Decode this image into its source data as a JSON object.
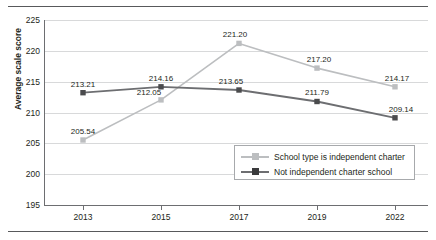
{
  "chart_data": {
    "type": "line",
    "title": "",
    "xlabel": "",
    "ylabel": "Average scale score",
    "categories": [
      "2013",
      "2015",
      "2017",
      "2019",
      "2022"
    ],
    "ylim": [
      195,
      225
    ],
    "yticks": [
      195,
      200,
      205,
      210,
      215,
      220,
      225
    ],
    "grid": true,
    "legend_position": "inside-lower-right",
    "series": [
      {
        "name": "School type is independent charter",
        "color": "#bcbec0",
        "marker": "square",
        "values": [
          205.54,
          212.05,
          221.2,
          217.2,
          214.17
        ],
        "labels": [
          "205.54",
          "212.05",
          "221.20",
          "217.20",
          "214.17"
        ]
      },
      {
        "name": "Not independent charter school",
        "color": "#6d6e71",
        "marker": "square",
        "values": [
          213.21,
          214.16,
          213.65,
          211.79,
          209.14
        ],
        "labels": [
          "213.21",
          "214.16",
          "213.65",
          "211.79",
          "209.14"
        ]
      }
    ]
  },
  "axis": {
    "y_label": "Average scale score",
    "y_tick_labels": [
      "225",
      "220",
      "215",
      "210",
      "205",
      "200",
      "195"
    ],
    "x_tick_labels": [
      "2013",
      "2015",
      "2017",
      "2019",
      "2022"
    ]
  },
  "legend": {
    "entries": [
      {
        "label": "School type is independent charter"
      },
      {
        "label": "Not independent charter school"
      }
    ]
  },
  "colors": {
    "series_light": "#bcbec0",
    "series_dark": "#6d6e71",
    "gridline": "#d8d9da",
    "axis": "#6d6e71",
    "rule": "#58595b",
    "text": "#231f20"
  }
}
